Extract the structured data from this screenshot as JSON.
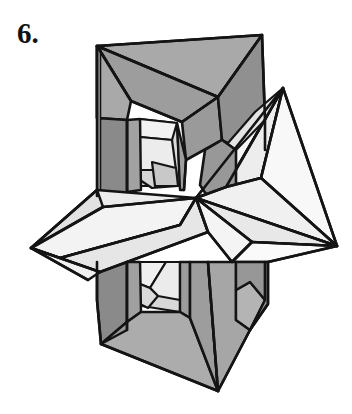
{
  "page": {
    "background_color": "#ffffff",
    "width": 352,
    "height": 414
  },
  "label": {
    "text": "6.",
    "color": "#111111"
  },
  "figure": {
    "name": "interlocking-polyhedra-line-drawing",
    "stroke_color": "#141414",
    "stroke_width": 2.6,
    "palette": {
      "gray_mid": "#a9a9a9",
      "gray_dark": "#8e8e8e",
      "gray_darker": "#7d7d7d",
      "gray_light": "#c2c2c2",
      "white_face": "#f4f4f4",
      "white_face_2": "#e9e9e9",
      "white_face_3": "#dddddd",
      "white_bright": "#fbfbfb"
    },
    "key_vertices": {
      "top_left": [
        97,
        46
      ],
      "top_right": [
        262,
        35
      ],
      "top_inner": [
        218,
        97
      ],
      "bottom_apex": [
        218,
        391
      ],
      "bottom_left": [
        101,
        344
      ],
      "left_tip": [
        31,
        248
      ],
      "right_tip": [
        337,
        246
      ],
      "pyramid_apex": [
        283,
        88
      ],
      "center_junction": [
        196,
        198
      ]
    }
  }
}
